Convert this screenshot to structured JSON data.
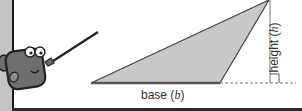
{
  "diagram": {
    "type": "triangle-area-illustration",
    "labels": {
      "base": "base",
      "base_var": "b",
      "height": "height",
      "height_var": "h"
    },
    "colors": {
      "triangle_fill": "#c8c8c8",
      "triangle_stroke": "#444444",
      "character_body": "#6e6e6e",
      "left_strip": "#c4c4c4"
    }
  }
}
